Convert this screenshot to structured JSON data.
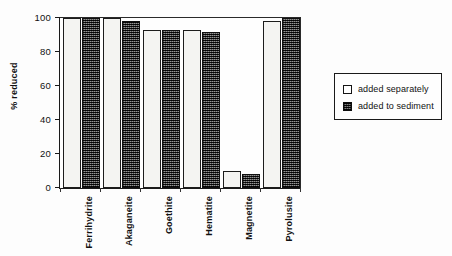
{
  "chart_data": {
    "type": "bar",
    "title": "",
    "subtitle": "",
    "xlabel": "",
    "ylabel": "% reduced",
    "ylim": [
      0,
      100
    ],
    "yticks": [
      0,
      20,
      40,
      60,
      80,
      100
    ],
    "grid": false,
    "legend_position": "right",
    "categories": [
      "Ferrihydrite",
      "Akaganeite",
      "Goethite",
      "Hematite",
      "Magnetite",
      "Pyrolusite"
    ],
    "series": [
      {
        "name": "added separately",
        "fill": "open",
        "color": "#f4f4f2",
        "values": [
          100,
          100,
          93,
          93,
          10,
          98
        ]
      },
      {
        "name": "added to sediment",
        "fill": "dark-dither",
        "color": "#3a3a3a",
        "values": [
          100,
          98,
          93,
          92,
          8,
          100
        ]
      }
    ]
  },
  "legend": {
    "items": [
      {
        "label": "added separately"
      },
      {
        "label": "added to sediment"
      }
    ]
  }
}
